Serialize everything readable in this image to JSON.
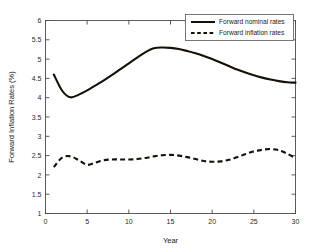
{
  "chart_data": {
    "type": "line",
    "title": "",
    "xlabel": "Year",
    "ylabel": "Forward Inflation Rates (%)",
    "xlim": [
      0,
      30
    ],
    "ylim": [
      1,
      6
    ],
    "xticks": [
      0,
      5,
      10,
      15,
      20,
      25,
      30
    ],
    "xtick_labels": [
      "0",
      "5",
      "10",
      "15",
      "20",
      "25",
      "30"
    ],
    "yticks": [
      1,
      1.5,
      2,
      2.5,
      3,
      3.5,
      4,
      4.5,
      5,
      5.5,
      6
    ],
    "ytick_labels": [
      "1",
      "1.5",
      "2",
      "2.5",
      "3",
      "3.5",
      "4",
      "4.5",
      "5",
      "5.5",
      "6"
    ],
    "grid": false,
    "legend_position": "upper right",
    "x": [
      1,
      2,
      3,
      4,
      5,
      6,
      7,
      8,
      9,
      10,
      11,
      12,
      13,
      14,
      15,
      16,
      17,
      18,
      19,
      20,
      21,
      22,
      23,
      24,
      25,
      26,
      27,
      28,
      29,
      30
    ],
    "series": [
      {
        "name": "Forward nominal rates",
        "style": "solid",
        "color": "#141008",
        "values": [
          4.6,
          4.18,
          4.01,
          4.08,
          4.19,
          4.32,
          4.45,
          4.59,
          4.74,
          4.89,
          5.04,
          5.18,
          5.28,
          5.3,
          5.29,
          5.26,
          5.21,
          5.15,
          5.08,
          5.0,
          4.91,
          4.82,
          4.73,
          4.65,
          4.58,
          4.52,
          4.47,
          4.43,
          4.4,
          4.39
        ]
      },
      {
        "name": "Forward inflation rates",
        "style": "dashed",
        "color": "#141008",
        "values": [
          2.2,
          2.45,
          2.48,
          2.38,
          2.26,
          2.32,
          2.38,
          2.4,
          2.4,
          2.4,
          2.41,
          2.44,
          2.48,
          2.51,
          2.52,
          2.5,
          2.46,
          2.41,
          2.36,
          2.34,
          2.35,
          2.39,
          2.46,
          2.54,
          2.61,
          2.65,
          2.67,
          2.64,
          2.55,
          2.43
        ]
      }
    ]
  },
  "legend": {
    "entries": [
      {
        "label": "Forward nominal rates"
      },
      {
        "label": "Forward inflation rates"
      }
    ]
  }
}
